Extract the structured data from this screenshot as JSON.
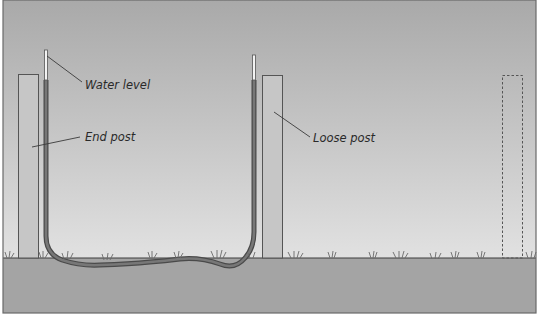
{
  "diagram": {
    "colors": {
      "sky_top": "#a9a9a9",
      "sky_bottom": "#ececec",
      "ground": "#a3a3a3",
      "post_fill": "#c4c4c4",
      "post_stroke": "#555555",
      "hose": "#5e5e5e",
      "water_column": "#6d6d6d",
      "tube_empty": "#f2f2f2",
      "grass": "#707070",
      "leader_line": "#3a3a3a",
      "frame": "#6a6a6a"
    },
    "labels": {
      "water_level": "Water level",
      "end_post": "End post",
      "loose_post": "Loose post"
    },
    "elements": [
      {
        "name": "end-post",
        "x": 18,
        "y": 74,
        "w": 20,
        "h": 184
      },
      {
        "name": "loose-post",
        "x": 262,
        "y": 75,
        "w": 20,
        "h": 183
      },
      {
        "name": "future-post-outline",
        "x": 503,
        "y": 75,
        "w": 20,
        "h": 183,
        "style": "dashed"
      }
    ],
    "ground_line_y": 258
  }
}
